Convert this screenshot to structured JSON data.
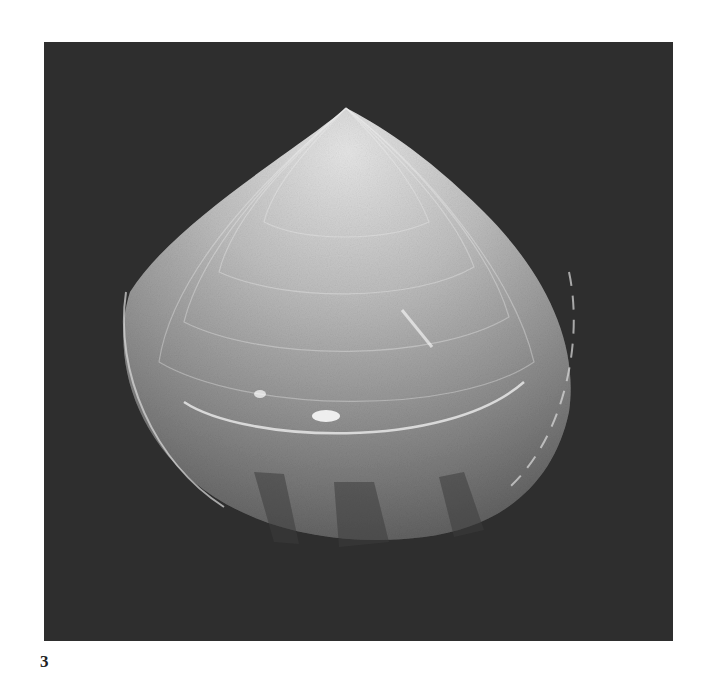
{
  "figure": {
    "label": "3",
    "colors": {
      "background": "#2e2e2e",
      "shell_light": "#d8d8d8",
      "shell_mid": "#9a9a9a",
      "page": "#ffffff"
    }
  }
}
